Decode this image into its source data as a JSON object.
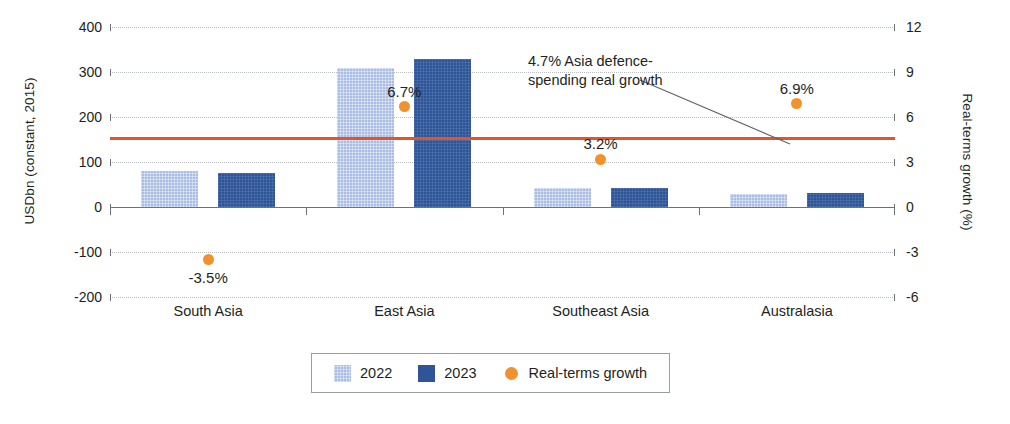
{
  "chart_data": {
    "type": "bar",
    "title": "",
    "subtitle": "",
    "categories": [
      "South Asia",
      "East Asia",
      "Southeast Asia",
      "Australasia"
    ],
    "series": [
      {
        "name": "2022",
        "color": "#aabde4",
        "axis": "left",
        "values": [
          80,
          308,
          42,
          30
        ]
      },
      {
        "name": "2023",
        "color": "#2f5599",
        "axis": "left",
        "values": [
          76,
          328,
          43,
          31
        ]
      },
      {
        "name": "Real-terms growth",
        "color": "#f0922e",
        "axis": "right",
        "type": "scatter",
        "values": [
          -3.5,
          6.7,
          3.2,
          6.9
        ],
        "labels": [
          "-3.5%",
          "6.7%",
          "3.2%",
          "6.9%"
        ]
      }
    ],
    "ylabel": "USDbn (constant, 2015)",
    "y2label": "Real-terms growth (%)",
    "xlabel": "",
    "ylim": [
      -200,
      400
    ],
    "y2lim": [
      -6,
      12
    ],
    "yticks": [
      "400",
      "300",
      "200",
      "100",
      "0",
      "-100",
      "-200"
    ],
    "ytick_values": [
      400,
      300,
      200,
      100,
      0,
      -100,
      -200
    ],
    "y2ticks": [
      "12",
      "9",
      "6",
      "3",
      "0",
      "-3",
      "-6"
    ],
    "y2tick_values": [
      12,
      9,
      6,
      3,
      0,
      -3,
      -6
    ],
    "grid": true,
    "legend_position": "bottom",
    "reference_line": {
      "value": 4.7,
      "axis": "right",
      "color": "#e4532a",
      "annotation": "4.7% Asia defence-spending real growth",
      "annotation_line1": "4.7% Asia defence-",
      "annotation_line2": "spending real growth"
    }
  },
  "legend": {
    "items": [
      {
        "label": "2022",
        "marker": "square-swatch",
        "color": "#aabde4"
      },
      {
        "label": "2023",
        "marker": "square-swatch",
        "color": "#2f5599"
      },
      {
        "label": "Real-terms growth",
        "marker": "circle-dot",
        "color": "#f0922e"
      }
    ]
  },
  "colors": {
    "bar_2022": "#aabde4",
    "bar_2023": "#2f5599",
    "growth_dot": "#f0922e",
    "reference_line": "#e4532a",
    "axis": "#6d7278",
    "gridline": "#b9bcc0",
    "text": "#231f20"
  }
}
